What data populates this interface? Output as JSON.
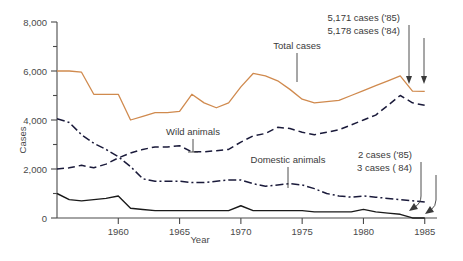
{
  "chart_data": {
    "type": "line",
    "title": "",
    "xlabel": "Year",
    "ylabel": "Cases",
    "xlim": [
      1955,
      1986
    ],
    "ylim": [
      0,
      8000
    ],
    "grid": false,
    "legend": "inline-labels",
    "x_ticks": [
      1960,
      1965,
      1970,
      1975,
      1980,
      1985
    ],
    "x_tick_labels": [
      "1960",
      "1965",
      "1970",
      "1975",
      "1980",
      "1985"
    ],
    "y_ticks": [
      0,
      2000,
      4000,
      6000,
      8000
    ],
    "y_tick_labels": [
      "0",
      "2,000",
      "4,000",
      "6,000",
      "8,000"
    ],
    "y_minor_ticks": [
      1000,
      3000,
      5000,
      7000
    ],
    "x": [
      1955,
      1956,
      1957,
      1958,
      1959,
      1960,
      1961,
      1962,
      1963,
      1964,
      1965,
      1966,
      1967,
      1968,
      1969,
      1970,
      1971,
      1972,
      1973,
      1974,
      1975,
      1976,
      1977,
      1978,
      1979,
      1980,
      1981,
      1982,
      1983,
      1984,
      1985
    ],
    "series": [
      {
        "name": "Total cases",
        "style": "solid",
        "color": "#d08a4e",
        "values": [
          6000,
          6000,
          5950,
          5050,
          5050,
          5050,
          4000,
          4150,
          4300,
          4300,
          4350,
          5050,
          4700,
          4500,
          4700,
          5350,
          5900,
          5800,
          5600,
          5250,
          4850,
          4700,
          4750,
          4800,
          5000,
          5200,
          5400,
          5600,
          5800,
          5178,
          5171
        ]
      },
      {
        "name": "Wild animals",
        "style": "dashed",
        "color": "#1a1a3a",
        "values": [
          2000,
          2050,
          2150,
          2050,
          2200,
          2450,
          2650,
          2800,
          2900,
          2900,
          2950,
          2700,
          2700,
          2750,
          2800,
          3100,
          3350,
          3450,
          3700,
          3650,
          3500,
          3400,
          3500,
          3600,
          3800,
          4000,
          4200,
          4600,
          5000,
          4700,
          4600
        ]
      },
      {
        "name": "Domestic animals",
        "style": "dash-dot",
        "color": "#1a1a3a",
        "values": [
          4050,
          3900,
          3400,
          3050,
          2800,
          2500,
          2100,
          1600,
          1500,
          1500,
          1500,
          1450,
          1450,
          1500,
          1550,
          1550,
          1400,
          1300,
          1350,
          1400,
          1350,
          1200,
          1000,
          900,
          850,
          900,
          850,
          800,
          750,
          700,
          650
        ]
      },
      {
        "name": "Human and other",
        "style": "solid-black",
        "color": "#1a1a1a",
        "values": [
          1000,
          750,
          700,
          750,
          800,
          900,
          400,
          350,
          300,
          300,
          300,
          300,
          300,
          300,
          300,
          500,
          300,
          300,
          300,
          300,
          300,
          250,
          250,
          250,
          250,
          350,
          250,
          200,
          150,
          3,
          2
        ]
      }
    ],
    "annotations": [
      {
        "id": "total-85",
        "text": "5,171 cases ('85)",
        "value": 5171,
        "year": 1985
      },
      {
        "id": "total-84",
        "text": "5,178 cases ('84)",
        "value": 5178,
        "year": 1984
      },
      {
        "id": "other-85",
        "text": "2 cases ('85)",
        "value": 2,
        "year": 1985
      },
      {
        "id": "other-84",
        "text": "3 cases ( 84)",
        "value": 3,
        "year": 1984
      }
    ],
    "inline_labels": [
      {
        "id": "total-cases",
        "text": "Total cases"
      },
      {
        "id": "wild-animals",
        "text": "Wild animals"
      },
      {
        "id": "domestic-animals",
        "text": "Domestic animals"
      }
    ]
  }
}
